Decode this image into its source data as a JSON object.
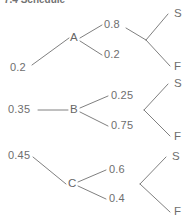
{
  "header": {
    "partial_text": "7.4  Schedule"
  },
  "diagram": {
    "stroke_color": "#808080",
    "text_color": "#6e6e6e",
    "root_branches": [
      {
        "probability": "0.2",
        "node": "A",
        "children": [
          {
            "probability": "0.8",
            "outcome": "S"
          },
          {
            "probability": "0.2",
            "outcome": "F"
          }
        ]
      },
      {
        "probability": "0.35",
        "node": "B",
        "children": [
          {
            "probability": "0.25",
            "outcome": "S"
          },
          {
            "probability": "0.75",
            "outcome": "F"
          }
        ]
      },
      {
        "probability": "0.45",
        "node": "C",
        "children": [
          {
            "probability": "0.6",
            "outcome": "S"
          },
          {
            "probability": "0.4",
            "outcome": "F"
          }
        ]
      }
    ]
  },
  "labels": {
    "p_a": "0.2",
    "p_b": "0.35",
    "p_c": "0.45",
    "node_a": "A",
    "node_b": "B",
    "node_c": "C",
    "a_s": "0.8",
    "a_f": "0.2",
    "b_s": "0.25",
    "b_f": "0.75",
    "c_s": "0.6",
    "c_f": "0.4",
    "leaf_a_s": "S",
    "leaf_a_f": "F",
    "leaf_b_s": "S",
    "leaf_b_f": "F",
    "leaf_c_s": "S",
    "leaf_c_f": "F"
  }
}
